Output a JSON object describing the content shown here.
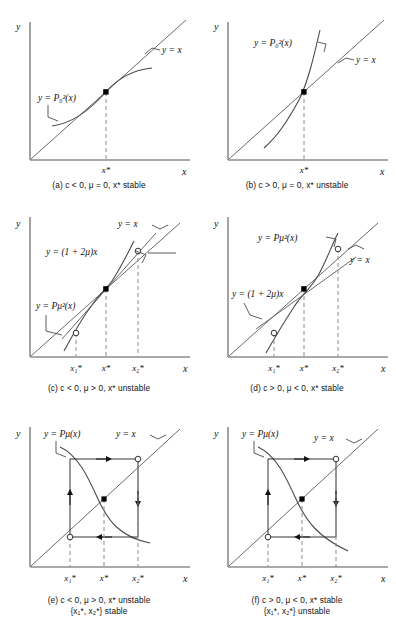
{
  "figure": {
    "axis_label_y": "y",
    "axis_label_x": "x",
    "tick_xstar": "x*",
    "tick_x1": "x₁*",
    "tick_x2": "x₂*"
  },
  "panels": [
    {
      "id": "a",
      "caption": "(a)  c < 0, μ = 0, x* stable",
      "caption_line1": "(a)  c < 0, μ = 0, x* stable",
      "caption_line2": "",
      "labels": {
        "line": "y = x",
        "curve": "y = P₀²(x)",
        "tangent": ""
      },
      "ticks": [
        "x*"
      ],
      "points": [
        {
          "type": "filled",
          "label": "x*"
        }
      ]
    },
    {
      "id": "b",
      "caption": "(b)  c > 0, μ = 0, x* unstable",
      "caption_line1": "(b)  c > 0, μ = 0, x* unstable",
      "caption_line2": "",
      "labels": {
        "line": "y = x",
        "curve": "y = P₀²(x)",
        "tangent": ""
      },
      "ticks": [
        "x*"
      ],
      "points": [
        {
          "type": "filled",
          "label": "x*"
        }
      ]
    },
    {
      "id": "c",
      "caption": "(c)  c < 0, μ > 0, x* unstable",
      "caption_line1": "(c)  c < 0, μ > 0, x* unstable",
      "caption_line2": "",
      "labels": {
        "line": "y = x",
        "curve": "y = Pμ²(x)",
        "tangent": "y = (1 + 2μ)x"
      },
      "ticks": [
        "x₁*",
        "x*",
        "x₂*"
      ],
      "points": [
        {
          "type": "open",
          "label": "x₁*"
        },
        {
          "type": "filled",
          "label": "x*"
        },
        {
          "type": "open",
          "label": "x₂*"
        }
      ]
    },
    {
      "id": "d",
      "caption": "(d)  c > 0, μ < 0, x* stable",
      "caption_line1": "(d)  c > 0, μ < 0, x* stable",
      "caption_line2": "",
      "labels": {
        "line": "y = x",
        "curve": "y = Pμ²(x)",
        "tangent": "y = (1 + 2μ)x"
      },
      "ticks": [
        "x₁*",
        "x*",
        "x₂*"
      ],
      "points": [
        {
          "type": "open",
          "label": "x₁*"
        },
        {
          "type": "filled",
          "label": "x*"
        },
        {
          "type": "open",
          "label": "x₂*"
        }
      ]
    },
    {
      "id": "e",
      "caption": "(e)  c < 0, μ > 0, x* unstable\n{x₁*, x₂*} stable",
      "caption_line1": "(e)  c < 0, μ > 0, x* unstable",
      "caption_line2": "{x₁*, x₂*} stable",
      "labels": {
        "line": "y = x",
        "curve": "y = Pμ(x)",
        "tangent": ""
      },
      "ticks": [
        "x₁*",
        "x*",
        "x₂*"
      ],
      "points": [
        {
          "type": "open",
          "label": "x₁*"
        },
        {
          "type": "filled",
          "label": "x*"
        },
        {
          "type": "open",
          "label": "x₂*"
        }
      ]
    },
    {
      "id": "f",
      "caption": "(f)  c > 0, μ < 0, x* stable\n{x₁*, x₂*} unstable",
      "caption_line1": "(f)  c > 0, μ < 0, x* stable",
      "caption_line2": "{x₁*, x₂*} unstable",
      "labels": {
        "line": "y = x",
        "curve": "y = Pμ(x)",
        "tangent": ""
      },
      "ticks": [
        "x₁*",
        "x*",
        "x₂*"
      ],
      "points": [
        {
          "type": "open",
          "label": "x₁*"
        },
        {
          "type": "filled",
          "label": "x*"
        },
        {
          "type": "open",
          "label": "x₂*"
        }
      ]
    }
  ],
  "colors": {
    "axis": "#8c8c8c",
    "curve": "#4a4a4a",
    "dashed": "#8c8c8c",
    "text": "#111111",
    "point_fill": "#000000",
    "point_open": "#ffffff"
  }
}
